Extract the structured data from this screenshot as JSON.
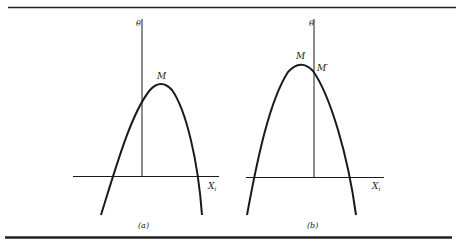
{
  "figure": {
    "panels": [
      {
        "id": "a",
        "caption": "(a)",
        "y_axis_label": "θ",
        "x_axis_label": "X",
        "x_axis_subscript": "i",
        "points": [
          {
            "label": "M",
            "description": "maximum of curve, to the right of the θ axis"
          }
        ]
      },
      {
        "id": "b",
        "caption": "(b)",
        "y_axis_label": "θ",
        "x_axis_label": "X",
        "x_axis_subscript": "i",
        "points": [
          {
            "label": "M",
            "description": "maximum of curve, to the left of the θ axis"
          },
          {
            "label": "M′",
            "description": "intersection of curve with the θ axis"
          }
        ]
      }
    ],
    "colors": {
      "ink": "#1a1a1a",
      "rule": "#222222",
      "background": "#ffffff"
    }
  }
}
